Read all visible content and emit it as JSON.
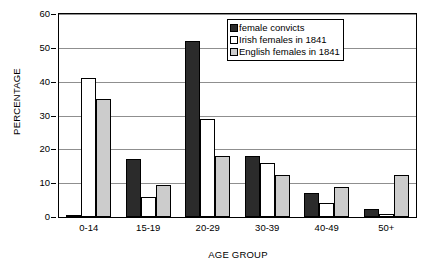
{
  "chart_data": {
    "type": "bar",
    "title": "",
    "subtitle": "",
    "xlabel": "AGE GROUP",
    "ylabel": "PERCENTAGE",
    "categories": [
      "0-14",
      "15-19",
      "20-29",
      "30-39",
      "40-49",
      "50+"
    ],
    "series": [
      {
        "name": "female convicts",
        "color": "#2b2b2b",
        "values": [
          0.5,
          17,
          52,
          18,
          7,
          2.5
        ]
      },
      {
        "name": "Irish females in 1841",
        "color": "#ffffff",
        "values": [
          41,
          6,
          29,
          16,
          4,
          1
        ]
      },
      {
        "name": "English females in 1841",
        "color": "#cccccc",
        "values": [
          35,
          9.5,
          18,
          12.5,
          9,
          12.5
        ]
      }
    ],
    "ylim": [
      0,
      60
    ],
    "ytick_values": [
      0,
      10,
      20,
      30,
      40,
      50,
      60
    ],
    "ytick_labels": [
      "0",
      "10",
      "20",
      "30",
      "40",
      "50",
      "60"
    ],
    "grid": true,
    "grid_axis": "y",
    "legend_position": "top-right",
    "bar_border_color": "#000000",
    "axis_color": "#000000"
  },
  "icons": {
    "legend_swatch": "color-swatch-icon"
  }
}
